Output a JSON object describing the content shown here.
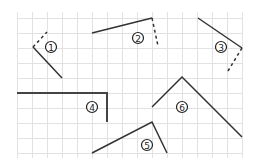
{
  "diagram": {
    "title": "",
    "grid": {
      "x_start": 17,
      "y_start": 18,
      "spacing": 15,
      "cols": 15,
      "rows": 9,
      "color": "#e2e2e2"
    },
    "line_color": "#333333",
    "figures": [
      {
        "id": 1,
        "label": "①",
        "label_pos": [
          51,
          47
        ],
        "solid": [
          [
            33,
            47
          ],
          [
            62,
            78
          ]
        ],
        "dashed": [
          [
            33,
            47
          ],
          [
            47,
            32
          ]
        ]
      },
      {
        "id": 2,
        "label": "②",
        "label_pos": [
          138,
          38
        ],
        "solid": [
          [
            92,
            33
          ],
          [
            152,
            18
          ]
        ],
        "dashed": [
          [
            152,
            18
          ],
          [
            158,
            46
          ]
        ]
      },
      {
        "id": 3,
        "label": "③",
        "label_pos": [
          221,
          47
        ],
        "solid": [
          [
            198,
            18
          ],
          [
            242,
            48
          ]
        ],
        "dashed": [
          [
            242,
            48
          ],
          [
            228,
            71
          ]
        ]
      },
      {
        "id": 4,
        "label": "④",
        "label_pos": [
          92,
          107
        ],
        "solid": [
          [
            17,
            93
          ],
          [
            107,
            93
          ],
          [
            107,
            122
          ]
        ],
        "dashed": []
      },
      {
        "id": 5,
        "label": "⑤",
        "label_pos": [
          147,
          145
        ],
        "solid": [
          [
            92,
            153
          ],
          [
            152,
            122
          ],
          [
            167,
            153
          ]
        ],
        "dashed": []
      },
      {
        "id": 6,
        "label": "⑥",
        "label_pos": [
          182,
          107
        ],
        "solid": [
          [
            152,
            107
          ],
          [
            182,
            77
          ],
          [
            242,
            137
          ]
        ],
        "dashed": []
      }
    ]
  }
}
